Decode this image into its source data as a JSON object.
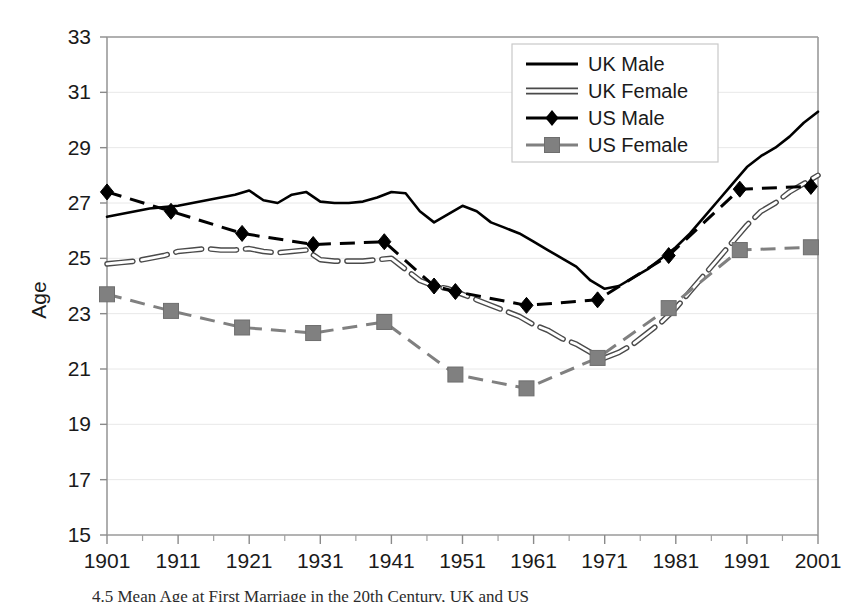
{
  "chart_data": {
    "type": "line",
    "title": "",
    "xlabel": "",
    "ylabel": "Age",
    "xlim": [
      1901,
      2001
    ],
    "ylim": [
      15,
      33
    ],
    "ytick_step": 2,
    "xtick_step": 10,
    "grid": true,
    "legend_position": "top-right",
    "xticks": [
      "1901",
      "1911",
      "1921",
      "1931",
      "1941",
      "1951",
      "1961",
      "1971",
      "1981",
      "1991",
      "2001"
    ],
    "yticks": [
      "15",
      "17",
      "19",
      "21",
      "23",
      "25",
      "27",
      "29",
      "31",
      "33"
    ],
    "series": [
      {
        "name": "UK Male",
        "style": "solid",
        "color": "#000000",
        "marker": "none",
        "x": [
          1901,
          1903,
          1905,
          1907,
          1909,
          1911,
          1913,
          1915,
          1917,
          1919,
          1921,
          1923,
          1925,
          1927,
          1929,
          1931,
          1933,
          1935,
          1937,
          1939,
          1941,
          1943,
          1945,
          1947,
          1949,
          1951,
          1953,
          1955,
          1957,
          1959,
          1961,
          1963,
          1965,
          1967,
          1969,
          1971,
          1973,
          1975,
          1977,
          1979,
          1981,
          1983,
          1985,
          1987,
          1989,
          1991,
          1993,
          1995,
          1997,
          1999,
          2001
        ],
        "y": [
          26.5,
          26.6,
          26.7,
          26.8,
          26.85,
          26.9,
          27.0,
          27.1,
          27.2,
          27.3,
          27.45,
          27.1,
          27.0,
          27.3,
          27.4,
          27.05,
          27.0,
          27.0,
          27.05,
          27.2,
          27.4,
          27.35,
          26.7,
          26.3,
          26.6,
          26.9,
          26.7,
          26.3,
          26.1,
          25.9,
          25.6,
          25.3,
          25.0,
          24.7,
          24.2,
          23.9,
          24.0,
          24.3,
          24.6,
          25.0,
          25.4,
          25.9,
          26.5,
          27.1,
          27.7,
          28.3,
          28.7,
          29.0,
          29.4,
          29.9,
          30.3
        ]
      },
      {
        "name": "UK Female",
        "style": "hollow",
        "color": "#555555",
        "marker": "none",
        "x": [
          1901,
          1903,
          1905,
          1907,
          1909,
          1911,
          1913,
          1915,
          1917,
          1919,
          1921,
          1923,
          1925,
          1927,
          1929,
          1931,
          1933,
          1935,
          1937,
          1939,
          1941,
          1943,
          1945,
          1947,
          1949,
          1951,
          1953,
          1955,
          1957,
          1959,
          1961,
          1963,
          1965,
          1967,
          1969,
          1971,
          1973,
          1975,
          1977,
          1979,
          1981,
          1983,
          1985,
          1987,
          1989,
          1991,
          1993,
          1995,
          1997,
          1999,
          2001
        ],
        "y": [
          24.8,
          24.85,
          24.9,
          25.0,
          25.1,
          25.25,
          25.3,
          25.35,
          25.3,
          25.3,
          25.35,
          25.25,
          25.2,
          25.25,
          25.3,
          24.95,
          24.9,
          24.9,
          24.9,
          24.95,
          25.0,
          24.6,
          24.2,
          24.0,
          23.9,
          23.7,
          23.5,
          23.3,
          23.1,
          22.9,
          22.6,
          22.4,
          22.1,
          21.9,
          21.6,
          21.4,
          21.6,
          21.9,
          22.3,
          22.7,
          23.2,
          23.8,
          24.4,
          25.0,
          25.6,
          26.2,
          26.7,
          27.0,
          27.4,
          27.7,
          28.0
        ]
      },
      {
        "name": "US Male",
        "style": "dashed",
        "color": "#000000",
        "marker": "diamond",
        "x": [
          1901,
          1910,
          1920,
          1930,
          1940,
          1947,
          1950,
          1960,
          1970,
          1980,
          1990,
          2000
        ],
        "y": [
          27.4,
          26.7,
          25.9,
          25.5,
          25.6,
          24.0,
          23.8,
          23.3,
          23.5,
          25.1,
          27.5,
          27.6
        ]
      },
      {
        "name": "US Female",
        "style": "dashed",
        "color": "#808080",
        "marker": "square",
        "x": [
          1901,
          1910,
          1920,
          1930,
          1940,
          1950,
          1960,
          1970,
          1980,
          1990,
          2000
        ],
        "y": [
          23.7,
          23.1,
          22.5,
          22.3,
          22.7,
          20.8,
          20.3,
          21.4,
          23.2,
          25.3,
          25.4
        ]
      }
    ]
  },
  "figure": {
    "caption": "4.5   Mean Age at First Marriage in the 20th Century, UK and US",
    "axis_title_y": "Age"
  },
  "legend": {
    "items": [
      {
        "label": "UK Male",
        "key": "uk-male"
      },
      {
        "label": "UK Female",
        "key": "uk-female"
      },
      {
        "label": "US Male",
        "key": "us-male"
      },
      {
        "label": "US Female",
        "key": "us-female"
      }
    ]
  }
}
